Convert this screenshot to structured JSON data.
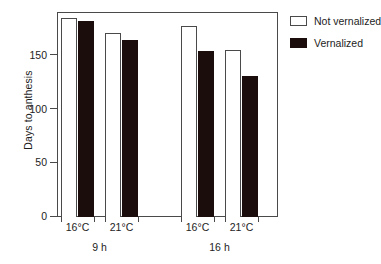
{
  "chart_data": {
    "type": "bar",
    "title": "",
    "xlabel": "",
    "ylabel": "Days to anthesis",
    "ylim": [
      0,
      190
    ],
    "yticks": [
      0,
      50,
      100,
      150
    ],
    "ytick_labels": [
      "0",
      "50",
      "100",
      "150"
    ],
    "grid": false,
    "legend_position": "right-top",
    "groups": [
      {
        "label": "9 h",
        "categories": [
          "16°C",
          "21°C"
        ]
      },
      {
        "label": "16 h",
        "categories": [
          "16°C",
          "21°C"
        ]
      }
    ],
    "categories": [
      "9 h / 16°C",
      "9 h / 21°C",
      "16 h / 16°C",
      "16 h / 21°C"
    ],
    "series": [
      {
        "name": "Not vernalized",
        "style": "open",
        "color": "#ffffff",
        "edge_color": "#4a4a4a",
        "values": [
          185,
          171,
          178,
          156
        ]
      },
      {
        "name": "Vernalized",
        "style": "filled",
        "color": "#1b0d0b",
        "edge_color": "#1b0d0b",
        "values": [
          183,
          165,
          155,
          131
        ]
      }
    ]
  },
  "axis": {
    "y_title": "Days to anthesis",
    "y_ticks": [
      {
        "value": 0,
        "label": "0"
      },
      {
        "value": 50,
        "label": "50"
      },
      {
        "value": 100,
        "label": "100"
      },
      {
        "value": 150,
        "label": "150"
      }
    ],
    "x_labels": [
      "16°C",
      "21°C",
      "16°C",
      "21°C"
    ],
    "group_labels": [
      "9 h",
      "16 h"
    ]
  },
  "legend": {
    "entries": [
      {
        "label": "Not vernalized",
        "swatch": "open-square-swatch"
      },
      {
        "label": "Vernalized",
        "swatch": "filled-square-swatch"
      }
    ]
  },
  "colors": {
    "bar_fill": "#1b0d0b",
    "bar_open": "#ffffff",
    "axis": "#4a4a4a",
    "text": "#1d1d1d",
    "background": "#ffffff"
  }
}
